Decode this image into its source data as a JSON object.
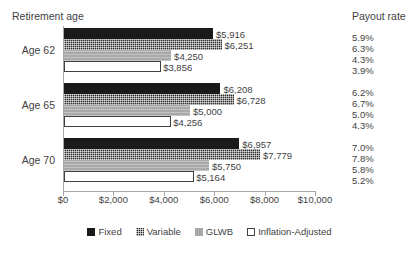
{
  "headers": {
    "retirement_age": "Retirement age",
    "payout_rate": "Payout rate"
  },
  "chart_data": {
    "type": "bar",
    "orientation": "horizontal",
    "title": "",
    "xlabel": "",
    "ylabel": "Retirement age",
    "xlim": [
      0,
      10000
    ],
    "xticks": [
      "$0",
      "$2,000",
      "$4,000",
      "$6,000",
      "$8,000",
      "$10,000"
    ],
    "xtick_values": [
      0,
      2000,
      4000,
      6000,
      8000,
      10000
    ],
    "grid": false,
    "legend_position": "bottom",
    "categories": [
      "Age 62",
      "Age 65",
      "Age 70"
    ],
    "series": [
      {
        "name": "Fixed",
        "color": "#1a1a1a",
        "values": [
          5916,
          6208,
          6957
        ],
        "labels": [
          "$5,916",
          "$6,208",
          "$6,957"
        ],
        "payout_rates": [
          "5.9%",
          "6.2%",
          "7.0%"
        ]
      },
      {
        "name": "Variable",
        "color": "#2b2b2b",
        "values": [
          6251,
          6728,
          7779
        ],
        "labels": [
          "$6,251",
          "$6,728",
          "$7,779"
        ],
        "payout_rates": [
          "6.3%",
          "6.7%",
          "7.8%"
        ]
      },
      {
        "name": "GLWB",
        "color": "#a9a9a9",
        "values": [
          4250,
          5000,
          5750
        ],
        "labels": [
          "$4,250",
          "$5,000",
          "$5,750"
        ],
        "payout_rates": [
          "4.3%",
          "5.0%",
          "5.8%"
        ]
      },
      {
        "name": "Inflation-Adjusted",
        "color": "#ffffff",
        "values": [
          3856,
          4256,
          5164
        ],
        "labels": [
          "$3,856",
          "$4,256",
          "$5,164"
        ],
        "payout_rates": [
          "3.9%",
          "4.3%",
          "5.2%"
        ]
      }
    ]
  }
}
